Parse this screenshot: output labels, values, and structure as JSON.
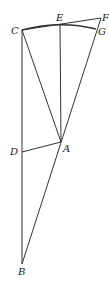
{
  "figure": {
    "points": {
      "C": {
        "label": "C",
        "x": 22,
        "y": 30
      },
      "E": {
        "label": "E",
        "x": 60,
        "y": 24
      },
      "F": {
        "label": "F",
        "x": 101,
        "y": 18
      },
      "G": {
        "label": "G",
        "x": 96,
        "y": 29
      },
      "A": {
        "label": "A",
        "x": 61,
        "y": 142
      },
      "D": {
        "label": "D",
        "x": 22,
        "y": 152
      },
      "B": {
        "label": "B",
        "x": 22,
        "y": 264
      }
    },
    "segments": [
      "CB",
      "CA",
      "EA",
      "CF",
      "FB",
      "DA",
      "arc CG"
    ]
  }
}
